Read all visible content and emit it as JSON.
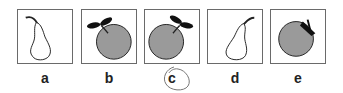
{
  "options": [
    {
      "label": "a",
      "figure": "pear-outline",
      "left": 17
    },
    {
      "label": "b",
      "figure": "gray-fruit-leaves-left",
      "left": 81
    },
    {
      "label": "c",
      "figure": "gray-fruit-leaves-right",
      "left": 144
    },
    {
      "label": "d",
      "figure": "pear-outline-stem-right",
      "left": 207
    },
    {
      "label": "e",
      "figure": "gray-fruit-dark-top",
      "left": 270
    }
  ],
  "selected": "c",
  "colors": {
    "fruit_fill": "#9a9a9a",
    "outline": "#222222",
    "border": "#6a6a6a"
  }
}
